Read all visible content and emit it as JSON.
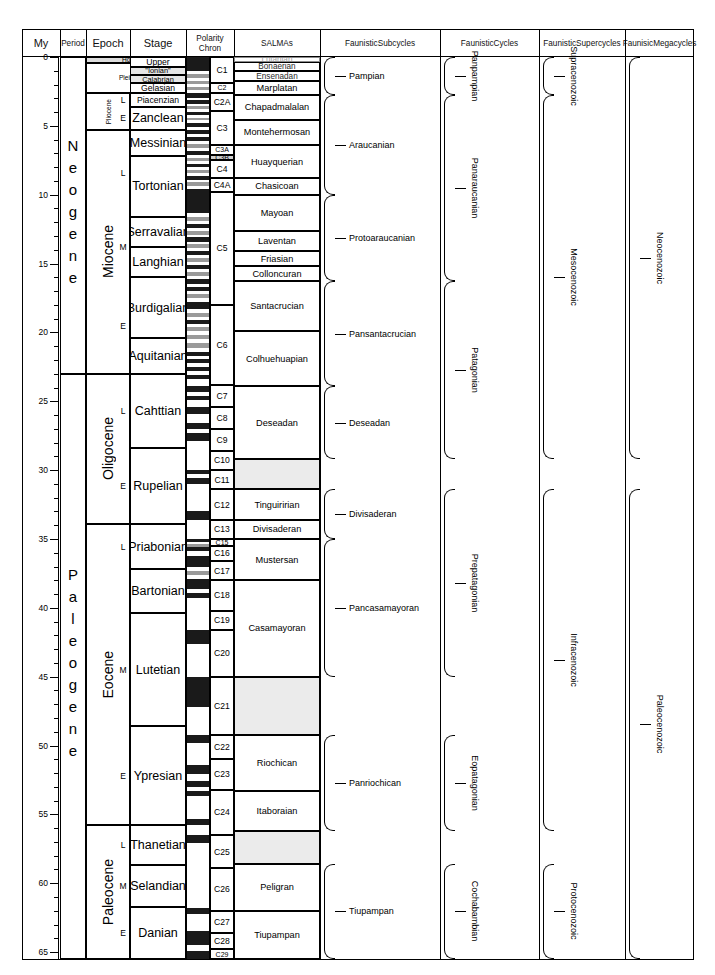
{
  "figure": {
    "type": "chart",
    "chart_kind": "stratigraphic-time-scale",
    "axis_unit": "My"
  },
  "headers": {
    "my": "My",
    "period": "Period",
    "epoch": "Epoch",
    "stage": "Stage",
    "polarity": "Polarity\nChron",
    "polarity_line1": "Polarity",
    "polarity_line2": "Chron",
    "salmas": "SALMAs",
    "subcycles_line1": "Faunistic",
    "subcycles_line2": "Subcycles",
    "cycles_line1": "Faunistic",
    "cycles_line2": "Cycles",
    "supercycles_line1": "Faunistic",
    "supercycles_line2": "Supercycles",
    "megacycles_line1": "Faunisic",
    "megacycles_line2": "Megacycles"
  },
  "chart_data": {
    "type": "table",
    "ylabel": "My",
    "ylim": [
      0,
      66
    ],
    "y_major_ticks": [
      0,
      5,
      10,
      15,
      20,
      25,
      30,
      35,
      40,
      45,
      50,
      55,
      60,
      65
    ],
    "y_minor_tick_interval": 1,
    "periods": [
      {
        "label": "Neogene",
        "top": 0,
        "bottom": 23.0
      },
      {
        "label": "Paleogene",
        "top": 23.0,
        "bottom": 65.5
      }
    ],
    "epochs": [
      {
        "label": "Holocene",
        "top": 0,
        "bottom": 0.4
      },
      {
        "label": "Pleistocene",
        "top": 0.4,
        "bottom": 2.6
      },
      {
        "label": "Pliocene",
        "top": 2.6,
        "bottom": 5.3
      },
      {
        "label": "Miocene",
        "top": 5.3,
        "bottom": 23.0
      },
      {
        "label": "Oligocene",
        "top": 23.0,
        "bottom": 33.9
      },
      {
        "label": "Eocene",
        "top": 33.9,
        "bottom": 55.8
      },
      {
        "label": "Paleocene",
        "top": 55.8,
        "bottom": 65.5
      }
    ],
    "subepochs": [
      {
        "label": "L",
        "top": 2.6,
        "bottom": 3.6
      },
      {
        "label": "E",
        "top": 3.6,
        "bottom": 5.3
      },
      {
        "label": "L",
        "top": 5.3,
        "bottom": 11.6
      },
      {
        "label": "M",
        "top": 11.6,
        "bottom": 16.0
      },
      {
        "label": "E",
        "top": 16.0,
        "bottom": 23.0
      },
      {
        "label": "L",
        "top": 23.0,
        "bottom": 28.4
      },
      {
        "label": "E",
        "top": 28.4,
        "bottom": 33.9
      },
      {
        "label": "L",
        "top": 33.9,
        "bottom": 37.2
      },
      {
        "label": "M",
        "top": 40.4,
        "bottom": 48.6
      },
      {
        "label": "E",
        "top": 48.6,
        "bottom": 55.8
      },
      {
        "label": "L",
        "top": 55.8,
        "bottom": 58.7
      },
      {
        "label": "M",
        "top": 58.7,
        "bottom": 61.7
      },
      {
        "label": "E",
        "top": 61.7,
        "bottom": 65.5
      }
    ],
    "stages": [
      {
        "label": "Upper",
        "top": 0.0,
        "bottom": 0.7
      },
      {
        "label": "\"Ionian\"",
        "top": 0.7,
        "bottom": 1.3
      },
      {
        "label": "Calabrian",
        "top": 1.3,
        "bottom": 1.9
      },
      {
        "label": "Gelasian",
        "top": 1.9,
        "bottom": 2.6
      },
      {
        "label": "Piacenzian",
        "top": 2.6,
        "bottom": 3.6
      },
      {
        "label": "Zanclean",
        "top": 3.6,
        "bottom": 5.3
      },
      {
        "label": "Messinian",
        "top": 5.3,
        "bottom": 7.2
      },
      {
        "label": "Tortonian",
        "top": 7.2,
        "bottom": 11.6
      },
      {
        "label": "Serravalian",
        "top": 11.6,
        "bottom": 13.8
      },
      {
        "label": "Langhian",
        "top": 13.8,
        "bottom": 16.0
      },
      {
        "label": "Burdigalian",
        "top": 16.0,
        "bottom": 20.4
      },
      {
        "label": "Aquitanian",
        "top": 20.4,
        "bottom": 23.0
      },
      {
        "label": "Cahttian",
        "top": 23.0,
        "bottom": 28.4
      },
      {
        "label": "Rupelian",
        "top": 28.4,
        "bottom": 33.9
      },
      {
        "label": "Priabonian",
        "top": 33.9,
        "bottom": 37.2
      },
      {
        "label": "Bartonian",
        "top": 37.2,
        "bottom": 40.4
      },
      {
        "label": "Lutetian",
        "top": 40.4,
        "bottom": 48.6
      },
      {
        "label": "Ypresian",
        "top": 48.6,
        "bottom": 55.8
      },
      {
        "label": "Thanetian",
        "top": 55.8,
        "bottom": 58.7
      },
      {
        "label": "Selandian",
        "top": 58.7,
        "bottom": 61.7
      },
      {
        "label": "Danian",
        "top": 61.7,
        "bottom": 65.5
      }
    ],
    "chrons": [
      {
        "label": "C1",
        "top": 0.0,
        "bottom": 1.9
      },
      {
        "label": "C2",
        "top": 1.9,
        "bottom": 2.6
      },
      {
        "label": "C2A",
        "top": 2.6,
        "bottom": 3.9
      },
      {
        "label": "C3",
        "top": 3.9,
        "bottom": 6.4
      },
      {
        "label": "C3A",
        "top": 6.4,
        "bottom": 7.1
      },
      {
        "label": "C3B",
        "top": 7.1,
        "bottom": 7.5
      },
      {
        "label": "C4",
        "top": 7.5,
        "bottom": 8.8
      },
      {
        "label": "C4A",
        "top": 8.8,
        "bottom": 9.8
      },
      {
        "label": "C5",
        "top": 9.8,
        "bottom": 18.0
      },
      {
        "label": "C6",
        "top": 18.0,
        "bottom": 23.8
      },
      {
        "label": "C7",
        "top": 23.8,
        "bottom": 25.4
      },
      {
        "label": "C8",
        "top": 25.4,
        "bottom": 27.0
      },
      {
        "label": "C9",
        "top": 27.0,
        "bottom": 28.6
      },
      {
        "label": "C10",
        "top": 28.6,
        "bottom": 30.0
      },
      {
        "label": "C11",
        "top": 30.0,
        "bottom": 31.4
      },
      {
        "label": "C12",
        "top": 31.4,
        "bottom": 33.6
      },
      {
        "label": "C13",
        "top": 33.6,
        "bottom": 35.0
      },
      {
        "label": "C15",
        "top": 35.0,
        "bottom": 35.5
      },
      {
        "label": "C16",
        "top": 35.5,
        "bottom": 36.6
      },
      {
        "label": "C17",
        "top": 36.6,
        "bottom": 38.0
      },
      {
        "label": "C18",
        "top": 38.0,
        "bottom": 40.2
      },
      {
        "label": "C19",
        "top": 40.2,
        "bottom": 41.6
      },
      {
        "label": "C20",
        "top": 41.6,
        "bottom": 45.0
      },
      {
        "label": "C21",
        "top": 45.0,
        "bottom": 49.2
      },
      {
        "label": "C22",
        "top": 49.2,
        "bottom": 51.0
      },
      {
        "label": "C23",
        "top": 51.0,
        "bottom": 53.2
      },
      {
        "label": "C24",
        "top": 53.2,
        "bottom": 56.5
      },
      {
        "label": "C25",
        "top": 56.5,
        "bottom": 58.9
      },
      {
        "label": "C26",
        "top": 58.9,
        "bottom": 62.0
      },
      {
        "label": "C27",
        "top": 62.0,
        "bottom": 63.6
      },
      {
        "label": "C28",
        "top": 63.6,
        "bottom": 64.8
      },
      {
        "label": "C29",
        "top": 64.8,
        "bottom": 65.5
      }
    ],
    "salmas": [
      {
        "label": "Lujanian",
        "top": 0.0,
        "bottom": 0.35,
        "faint": true
      },
      {
        "label": "Bonaerian",
        "top": 0.35,
        "bottom": 1.05
      },
      {
        "label": "Ensenadan",
        "top": 1.05,
        "bottom": 1.75
      },
      {
        "label": "Marplatan",
        "top": 1.75,
        "bottom": 2.75
      },
      {
        "label": "Chapadmalalan",
        "top": 2.75,
        "bottom": 4.55
      },
      {
        "label": "Montehermosan",
        "top": 4.55,
        "bottom": 6.4
      },
      {
        "label": "Huayquerian",
        "top": 6.4,
        "bottom": 8.8
      },
      {
        "label": "Chasicoan",
        "top": 8.8,
        "bottom": 10.0
      },
      {
        "label": "Mayoan",
        "top": 10.0,
        "bottom": 12.6
      },
      {
        "label": "Laventan",
        "top": 12.6,
        "bottom": 14.1
      },
      {
        "label": "Friasian",
        "top": 14.1,
        "bottom": 15.2
      },
      {
        "label": "Colloncuran",
        "top": 15.2,
        "bottom": 16.3
      },
      {
        "label": "Santacrucian",
        "top": 16.3,
        "bottom": 19.9
      },
      {
        "label": "Colhuehuapian",
        "top": 19.9,
        "bottom": 23.9
      },
      {
        "label": "Deseadan",
        "top": 23.9,
        "bottom": 29.2
      },
      {
        "label": "Tinguiririan",
        "top": 31.4,
        "bottom": 33.6
      },
      {
        "label": "Divisaderan",
        "top": 33.6,
        "bottom": 35.0
      },
      {
        "label": "Mustersan",
        "top": 35.0,
        "bottom": 38.0
      },
      {
        "label": "Casamayoran",
        "top": 38.0,
        "bottom": 45.0
      },
      {
        "label": "Riochican",
        "top": 49.2,
        "bottom": 53.3
      },
      {
        "label": "Itaboraian",
        "top": 53.3,
        "bottom": 56.2
      },
      {
        "label": "Peligran",
        "top": 58.6,
        "bottom": 62.0
      },
      {
        "label": "Tiupampan",
        "top": 62.0,
        "bottom": 65.5
      }
    ],
    "faunistic_subcycles": [
      {
        "label": "Pampian",
        "top": 0.0,
        "bottom": 2.75
      },
      {
        "label": "Araucanian",
        "top": 2.75,
        "bottom": 10.0
      },
      {
        "label": "Protoaraucanian",
        "top": 10.0,
        "bottom": 16.3
      },
      {
        "label": "Pansantacrucian",
        "top": 16.3,
        "bottom": 23.9
      },
      {
        "label": "Deseadan",
        "top": 23.9,
        "bottom": 29.2
      },
      {
        "label": "Divisaderan",
        "top": 31.4,
        "bottom": 35.0
      },
      {
        "label": "Pancasamayoran",
        "top": 35.0,
        "bottom": 45.0
      },
      {
        "label": "Panriochican",
        "top": 49.2,
        "bottom": 56.2
      },
      {
        "label": "Tiupampan",
        "top": 58.6,
        "bottom": 65.5
      }
    ],
    "faunistic_cycles": [
      {
        "label": "Panpampian",
        "top": 0.0,
        "bottom": 2.75
      },
      {
        "label": "Panaraucanian",
        "top": 2.75,
        "bottom": 16.3
      },
      {
        "label": "Patagonian",
        "top": 16.3,
        "bottom": 29.2
      },
      {
        "label": "Prepatagonian",
        "top": 31.4,
        "bottom": 45.0
      },
      {
        "label": "Eopatagonian",
        "top": 49.2,
        "bottom": 56.2
      },
      {
        "label": "Cochabambian",
        "top": 58.6,
        "bottom": 65.5
      }
    ],
    "faunistic_supercycles": [
      {
        "label": "Supracenozoic",
        "top": 0.0,
        "bottom": 2.75
      },
      {
        "label": "Mesocenozoic",
        "top": 2.75,
        "bottom": 29.2
      },
      {
        "label": "Infracenozoic",
        "top": 31.4,
        "bottom": 56.2
      },
      {
        "label": "Protocenozoic",
        "top": 58.6,
        "bottom": 65.5
      }
    ],
    "faunistic_megacycles": [
      {
        "label": "Neocenozoic",
        "top": 0.0,
        "bottom": 29.2
      },
      {
        "label": "Paleocenozoic",
        "top": 31.4,
        "bottom": 65.5
      }
    ]
  }
}
